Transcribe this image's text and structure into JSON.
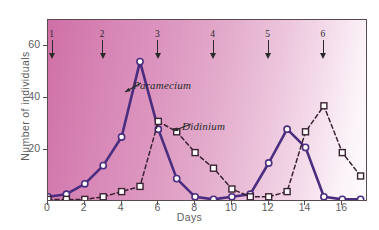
{
  "chart_data": {
    "type": "line",
    "title": "",
    "annotation_title": "Immigrations",
    "xlabel": "Days",
    "ylabel": "Number of individuals",
    "xlim": [
      0,
      17.4
    ],
    "ylim": [
      0,
      70
    ],
    "xticks": [
      0,
      2,
      4,
      6,
      8,
      10,
      12,
      14,
      16
    ],
    "yticks": [
      20,
      40,
      60
    ],
    "grid": false,
    "legend_position": "inline-annotations",
    "x": [
      0,
      1,
      2,
      3,
      4,
      5,
      6,
      7,
      8,
      9,
      10,
      11,
      12,
      13,
      14,
      15,
      16,
      17
    ],
    "series": [
      {
        "name": "Paramecium",
        "style": "solid",
        "marker": "circle",
        "color": "#4b2d7f",
        "values": [
          2,
          3,
          7,
          14,
          25,
          54,
          28,
          9,
          2,
          1,
          2,
          3,
          15,
          28,
          21,
          2,
          1,
          1
        ]
      },
      {
        "name": "Didinium",
        "style": "dashed",
        "marker": "square",
        "color": "#3a2233",
        "values": [
          1,
          1,
          1,
          2,
          4,
          6,
          31,
          27,
          19,
          13,
          5,
          2,
          2,
          4,
          27,
          37,
          19,
          10
        ]
      }
    ],
    "annotations": [
      {
        "label": "Paramecium",
        "target_x": 5,
        "target_y": 54
      },
      {
        "label": "Didinium",
        "target_x": 6.6,
        "target_y": 29
      }
    ],
    "immigration_arrows": [
      {
        "label": "1",
        "day": 0.25
      },
      {
        "label": "2",
        "day": 3.0
      },
      {
        "label": "3",
        "day": 6.0
      },
      {
        "label": "4",
        "day": 9.0
      },
      {
        "label": "5",
        "day": 12.0
      },
      {
        "label": "6",
        "day": 15.0
      }
    ],
    "background": {
      "from": "#cf6fa6",
      "to": "#fdfbfd"
    }
  }
}
